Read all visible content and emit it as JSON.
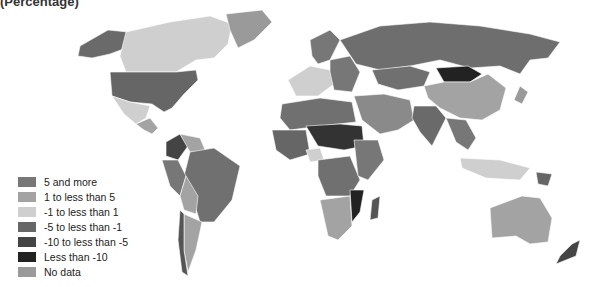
{
  "title": "(Percentage)",
  "legend": {
    "items": [
      {
        "label": "5 and more",
        "color": "#777777"
      },
      {
        "label": "1 to less than 5",
        "color": "#a3a3a3"
      },
      {
        "label": "-1 to less than 1",
        "color": "#cfcfcf"
      },
      {
        "label": "-5 to less than -1",
        "color": "#666666"
      },
      {
        "label": "-10 to less than -5",
        "color": "#444444"
      },
      {
        "label": "Less than -10",
        "color": "#222222"
      },
      {
        "label": "No data",
        "color": "#9a9a9a"
      }
    ]
  },
  "regions": {
    "alaska": "#6a6a6a",
    "canada": "#cfcfcf",
    "greenland": "#9a9a9a",
    "usa": "#666666",
    "mexico": "#cfcfcf",
    "central_america": "#a3a3a3",
    "colombia": "#444444",
    "venezuela": "#a3a3a3",
    "brazil": "#707070",
    "peru": "#777777",
    "bolivia": "#a3a3a3",
    "argentina": "#a3a3a3",
    "chile": "#555555",
    "europe_west": "#cfcfcf",
    "europe_east": "#777777",
    "scandinavia": "#777777",
    "russia": "#6e6e6e",
    "kazakhstan": "#707070",
    "mongolia": "#222222",
    "china": "#a3a3a3",
    "india": "#6a6a6a",
    "middle_east": "#8a8a8a",
    "se_asia": "#777777",
    "indonesia": "#cfcfcf",
    "australia": "#a3a3a3",
    "new_zealand": "#444444",
    "north_africa": "#707070",
    "sahel": "#333333",
    "west_africa": "#666666",
    "nigeria": "#cfcfcf",
    "central_africa": "#707070",
    "east_africa": "#777777",
    "southern_africa": "#a3a3a3",
    "mozambique": "#222222",
    "madagascar": "#555555",
    "japan": "#9a9a9a",
    "png": "#666666"
  }
}
